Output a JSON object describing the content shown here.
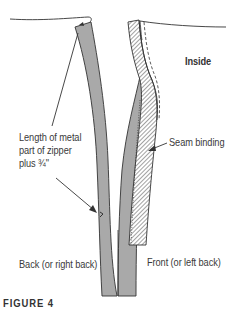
{
  "figure": {
    "caption": "FIGURE 4",
    "labels": {
      "inside": "Inside",
      "length_line1": "Length of metal",
      "length_line2": "part of zipper",
      "length_line3": "plus ¾\"",
      "seam_binding": "Seam binding",
      "back": "Back (or right back)",
      "front": "Front (or left back)"
    },
    "colors": {
      "zipper_tape": "#a9a9a9",
      "outline": "#333333",
      "hatch": "#555555",
      "background": "#ffffff"
    }
  }
}
